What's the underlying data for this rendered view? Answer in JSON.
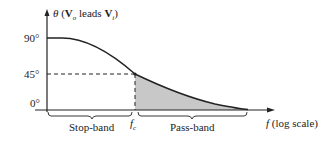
{
  "diagram": {
    "y_axis_label": {
      "theta": "θ",
      "open": " (",
      "vo": "V",
      "vo_sub": "o",
      "leads": " leads ",
      "vi": "V",
      "vi_sub": "i",
      "close": ")"
    },
    "y_ticks": [
      "90°",
      "45°",
      "0°"
    ],
    "x_axis_label": {
      "f": "f",
      "rest": " (log scale)"
    },
    "fc_label": {
      "f": "f",
      "sub": "c"
    },
    "regions": {
      "stop_band": "Stop-band",
      "pass_band": "Pass-band"
    },
    "colors": {
      "line": "#222222",
      "shade": "#c8c8c8",
      "background": "#ffffff"
    }
  }
}
